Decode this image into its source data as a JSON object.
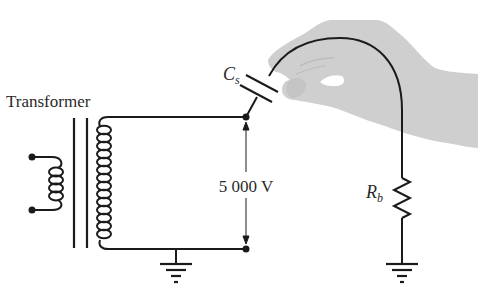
{
  "diagram": {
    "labels": {
      "transformer": "Transformer",
      "voltage": "5 000 V",
      "capacitor_main": "C",
      "capacitor_sub": "s",
      "resistor_main": "R",
      "resistor_sub": "b"
    },
    "colors": {
      "wire": "#1a1a1a",
      "hand_fill": "#cfcfcf",
      "hand_shade": "#bdbdbd",
      "background": "#ffffff"
    },
    "components": [
      {
        "type": "transformer",
        "label": "Transformer"
      },
      {
        "type": "capacitor",
        "label": "Cs"
      },
      {
        "type": "resistor",
        "label": "Rb"
      },
      {
        "type": "ground",
        "count": 2
      },
      {
        "type": "voltage-indicator",
        "label": "5 000 V"
      }
    ]
  }
}
